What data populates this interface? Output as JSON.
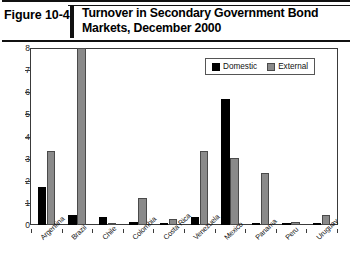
{
  "figure": {
    "number": "Figure 10-4",
    "title": "Turnover in Secondary Government Bond Markets, December 2000"
  },
  "chart_data": {
    "type": "bar",
    "title": "Turnover in Secondary Government Bond Markets, December 2000",
    "xlabel": "",
    "ylabel": "",
    "ylim": [
      0,
      8
    ],
    "yticks": [
      0,
      1,
      2,
      3,
      4,
      5,
      6,
      7,
      8
    ],
    "ytick_labels": [
      "0",
      "1",
      "2",
      "3",
      "4",
      "5",
      "6",
      "7",
      "8"
    ],
    "grid": false,
    "legend_position": "top-right",
    "categories": [
      "Argentina",
      "Brazil",
      "Chile",
      "Colombia",
      "Costa Rica",
      "Venezuela",
      "Mexico",
      "Panama",
      "Peru",
      "Uruguay"
    ],
    "series": [
      {
        "name": "Domestic",
        "color": "#000000",
        "values": [
          1.7,
          0.45,
          0.35,
          0.12,
          0.1,
          0.35,
          5.7,
          0.08,
          0.08,
          0.05
        ]
      },
      {
        "name": "External",
        "color": "#8a8a8a",
        "values": [
          3.35,
          8.0,
          0.1,
          1.2,
          0.25,
          3.35,
          3.05,
          2.35,
          0.12,
          0.45
        ]
      }
    ]
  }
}
